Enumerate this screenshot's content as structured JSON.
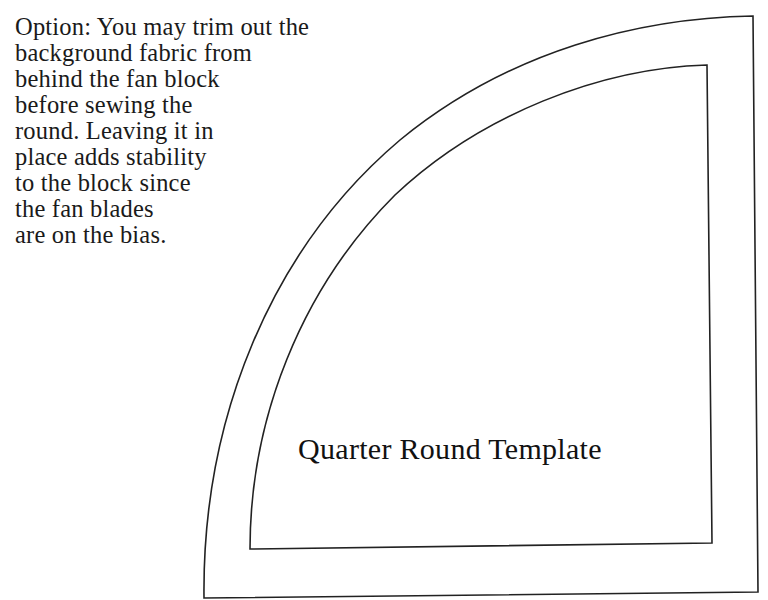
{
  "note": {
    "lines": [
      "Option: You may trim out the",
      "background fabric from",
      "behind the fan block",
      "before sewing the",
      "round. Leaving it in",
      "place adds stability",
      "to the block since",
      "the fan blades",
      "are on the bias."
    ]
  },
  "template": {
    "title": "Quarter Round Template",
    "stroke_color": "#222222"
  }
}
